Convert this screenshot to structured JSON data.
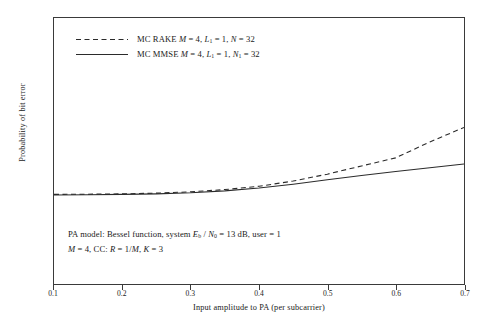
{
  "chart_data": {
    "type": "line",
    "title": "",
    "xlabel": "Input amplitude to PA (per subcarrier)",
    "ylabel": "Probability of bit error",
    "xlim": [
      0.1,
      0.7
    ],
    "ylim": [
      1e-06,
      1.0
    ],
    "yscale": "log",
    "grid": false,
    "legend_position": "upper-left",
    "xticks": [
      "0.1",
      "0.2",
      "0.3",
      "0.4",
      "0.5",
      "0.6",
      "0.7"
    ],
    "xtick_values": [
      0.1,
      0.2,
      0.3,
      0.4,
      0.5,
      0.6,
      0.7
    ],
    "yticks": [
      "10^0",
      "10^-3",
      "10^-6"
    ],
    "ytick_values": [
      1.0,
      0.001,
      1e-06
    ],
    "series": [
      {
        "name": "MC RAKE M = 4, L1 = 1, N = 32",
        "style": "dashed",
        "color": "#2b2b2b",
        "x": [
          0.1,
          0.15,
          0.2,
          0.25,
          0.3,
          0.35,
          0.4,
          0.45,
          0.5,
          0.55,
          0.6,
          0.65,
          0.7
        ],
        "y": [
          0.000105,
          0.000106,
          0.000108,
          0.000112,
          0.00012,
          0.000135,
          0.00016,
          0.00021,
          0.0003,
          0.00046,
          0.0007,
          0.0016,
          0.0034
        ]
      },
      {
        "name": "MC MMSE M = 4, L1 = 1, N1 = 32",
        "style": "solid",
        "color": "#2b2b2b",
        "x": [
          0.1,
          0.15,
          0.2,
          0.25,
          0.3,
          0.35,
          0.4,
          0.45,
          0.5,
          0.55,
          0.6,
          0.65,
          0.7
        ],
        "y": [
          0.000102,
          0.000103,
          0.000105,
          0.000108,
          0.000114,
          0.000126,
          0.000146,
          0.000178,
          0.000225,
          0.00028,
          0.000345,
          0.00042,
          0.00051
        ]
      }
    ],
    "annotations": [
      "PA model: Bessel function, system Eb / N0 = 13 dB, user = 1",
      "M = 4, CC: R = 1/M, K = 3"
    ]
  },
  "axes": {
    "y_label": "Probability of bit error",
    "x_label": "Input amplitude to PA (per subcarrier)",
    "x_ticks": [
      {
        "label": "0.1",
        "value": 0.1
      },
      {
        "label": "0.2",
        "value": 0.2
      },
      {
        "label": "0.3",
        "value": 0.3
      },
      {
        "label": "0.4",
        "value": 0.4
      },
      {
        "label": "0.5",
        "value": 0.5
      },
      {
        "label": "0.6",
        "value": 0.6
      },
      {
        "label": "0.7",
        "value": 0.7
      }
    ],
    "y_ticks": [
      {
        "base": "10",
        "exp": "0",
        "value": 1.0
      },
      {
        "base": "10",
        "exp": "-3",
        "value": 0.001
      },
      {
        "base": "10",
        "exp": "-6",
        "value": 1e-06
      }
    ]
  },
  "legend": {
    "entries": [
      {
        "style": "dashed",
        "prefix": "MC RAKE ",
        "v1": "M",
        "e1": " = 4, ",
        "v2": "L",
        "s2": "1",
        "e2": " = 1, ",
        "v3": "N",
        "s3": "",
        "e3": " = 32"
      },
      {
        "style": "solid",
        "prefix": "MC MMSE ",
        "v1": "M",
        "e1": " = 4, ",
        "v2": "L",
        "s2": "1",
        "e2": " = 1, ",
        "v3": "N",
        "s3": "1",
        "e3": " = 32"
      }
    ]
  },
  "annotation": {
    "line1_a": "PA model: Bessel function, system ",
    "line1_eb": "E",
    "line1_eb_sub": "b",
    "line1_slash": " / ",
    "line1_n0": "N",
    "line1_n0_sub": "0",
    "line1_b": " = 13 dB, user = 1",
    "line2_a": "M",
    "line2_b": " = 4, CC: ",
    "line2_r": "R",
    "line2_c": " = 1/",
    "line2_m": "M",
    "line2_d": ", ",
    "line2_k": "K",
    "line2_e": " = 3"
  },
  "colors": {
    "axis": "#3a3a3a",
    "curve": "#2b2b2b",
    "background": "#ffffff"
  }
}
